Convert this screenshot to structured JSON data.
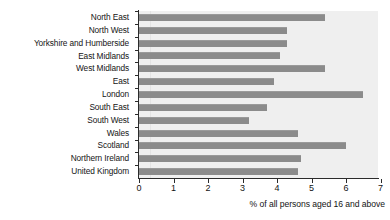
{
  "chart_data": {
    "type": "bar",
    "orientation": "horizontal",
    "title": "",
    "xlabel": "% of all persons aged 16 and above",
    "ylabel": "",
    "xlim": [
      0,
      7
    ],
    "ylim": null,
    "grid": false,
    "legend": null,
    "bar_color": "#8b8b8b",
    "plot_background": "#efefef",
    "xticks": [
      0,
      1,
      2,
      3,
      4,
      5,
      6,
      7
    ],
    "xticklabels": [
      "0",
      "1",
      "2",
      "3",
      "4",
      "5",
      "6",
      "7"
    ],
    "categories": [
      "North East",
      "North West",
      "Yorkshire and Humberside",
      "East Midlands",
      "West Midlands",
      "East",
      "London",
      "South East",
      "South West",
      "Wales",
      "Scotland",
      "Northern Ireland",
      "United Kingdom"
    ],
    "values": [
      5.4,
      4.3,
      4.3,
      4.1,
      5.4,
      3.9,
      6.5,
      3.7,
      3.2,
      4.6,
      6.0,
      4.7,
      4.6
    ]
  }
}
